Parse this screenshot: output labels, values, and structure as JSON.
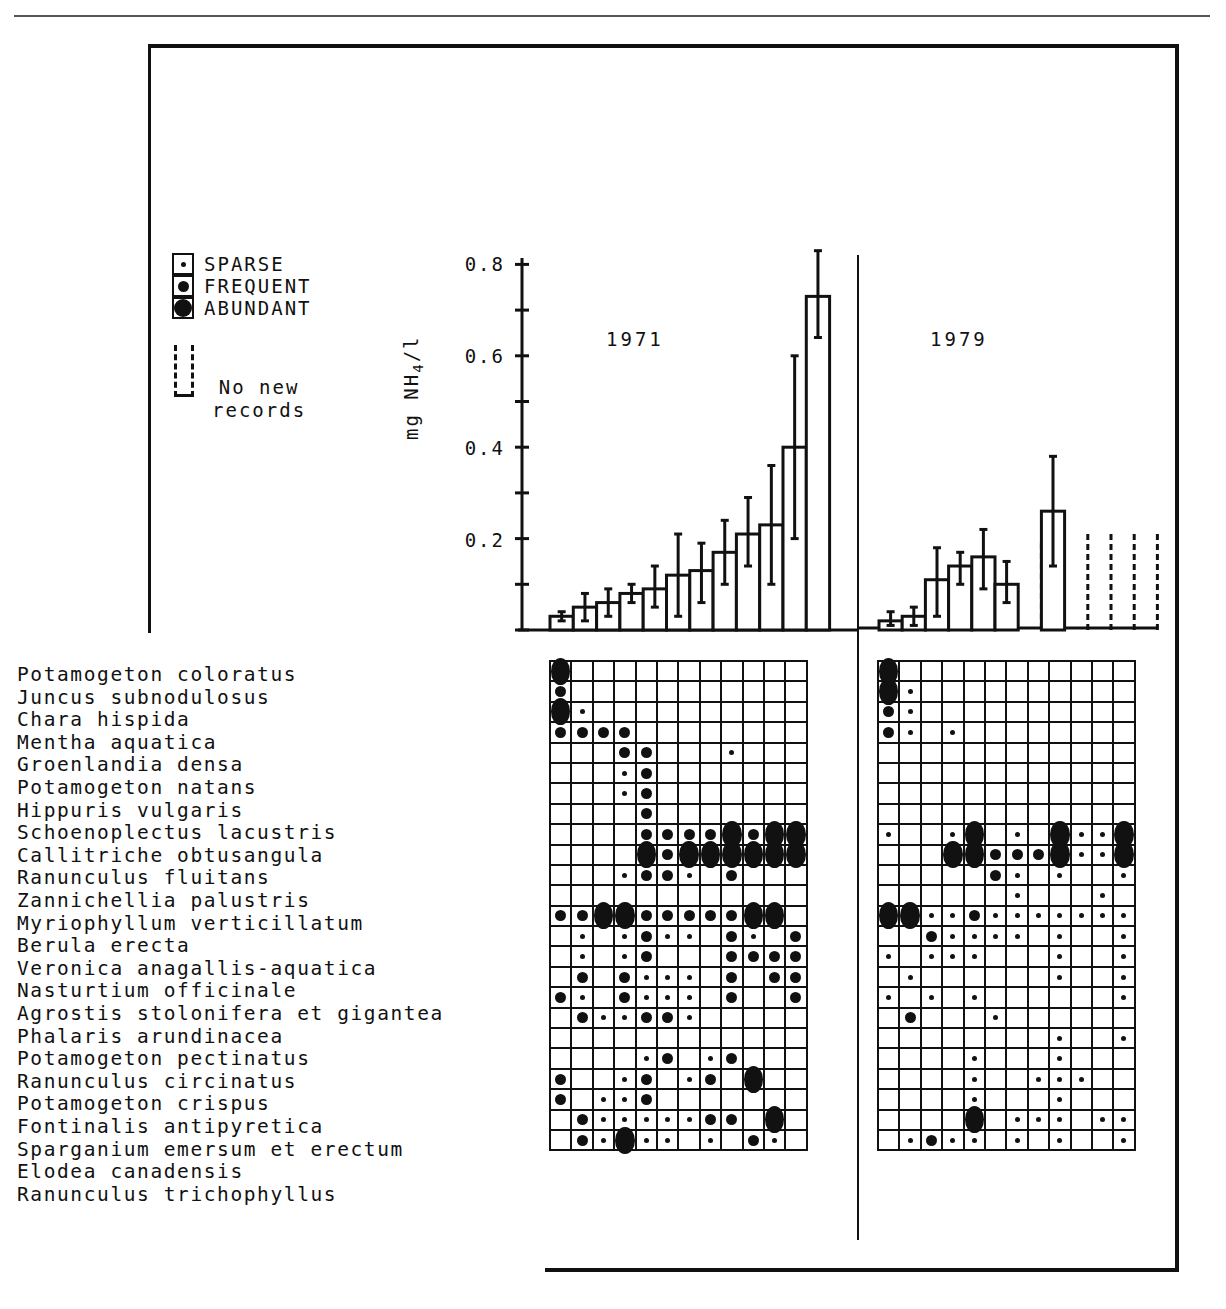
{
  "legend": {
    "items": [
      {
        "key": "S",
        "label": "SPARSE"
      },
      {
        "key": "F",
        "label": "FREQUENT"
      },
      {
        "key": "A",
        "label": "ABUNDANT"
      }
    ],
    "no_new_records_line1": "No new",
    "no_new_records_line2": "records"
  },
  "chart_data": [
    {
      "type": "bar",
      "title": "1971",
      "ylabel": "mg NH4/l",
      "xlabel": "",
      "ylim": [
        0,
        0.8
      ],
      "yticks": [
        "0.2",
        "0.4",
        "0.6",
        "0.8"
      ],
      "grid": false,
      "categories": [
        "1",
        "2",
        "3",
        "4",
        "5",
        "6",
        "7",
        "8",
        "9",
        "10",
        "11",
        "12"
      ],
      "values": [
        0.03,
        0.05,
        0.06,
        0.08,
        0.09,
        0.12,
        0.13,
        0.17,
        0.21,
        0.23,
        0.4,
        0.73
      ],
      "error_low": [
        0.02,
        0.02,
        0.03,
        0.06,
        0.05,
        0.03,
        0.06,
        0.1,
        0.14,
        0.1,
        0.2,
        0.64
      ],
      "error_high": [
        0.04,
        0.08,
        0.09,
        0.1,
        0.14,
        0.21,
        0.19,
        0.24,
        0.29,
        0.36,
        0.6,
        0.83
      ]
    },
    {
      "type": "bar",
      "title": "1979",
      "ylabel": "mg NH4/l",
      "xlabel": "",
      "ylim": [
        0,
        0.8
      ],
      "grid": false,
      "categories": [
        "1",
        "2",
        "3",
        "4",
        "5",
        "6",
        "7",
        "8",
        "9",
        "10",
        "11",
        "12"
      ],
      "values": [
        0.02,
        0.03,
        0.11,
        0.14,
        0.16,
        0.1,
        null,
        0.26,
        null,
        null,
        null,
        null
      ],
      "error_low": [
        0.01,
        0.01,
        0.03,
        0.1,
        0.09,
        0.06,
        null,
        0.14,
        null,
        null,
        null,
        null
      ],
      "error_high": [
        0.04,
        0.05,
        0.18,
        0.17,
        0.22,
        0.15,
        null,
        0.38,
        null,
        null,
        null,
        null
      ],
      "no_new_records": [
        7,
        9,
        10,
        11,
        12
      ]
    },
    {
      "type": "table",
      "title": "Species abundance by site (S = sparse, F = frequent, A = abundant)",
      "species": [
        "Potamogeton coloratus",
        "Juncus subnodulosus",
        "Chara hispida",
        "Mentha aquatica",
        "Groenlandia densa",
        "Potamogeton natans",
        "Hippuris vulgaris",
        "Schoenoplectus lacustris",
        "Callitriche obtusangula",
        "Ranunculus fluitans",
        "Zannichellia palustris",
        "Myriophyllum verticillatum",
        "Berula erecta",
        "Veronica anagallis-aquatica",
        "Nasturtium officinale",
        "Agrostis stolonifera et gigantea",
        "Phalaris arundinacea",
        "Potamogeton pectinatus",
        "Ranunculus circinatus",
        "Potamogeton crispus",
        "Fontinalis antipyretica",
        "Sparganium emersum et erectum",
        "Elodea canadensis",
        "Ranunculus trichophyllus"
      ],
      "grid_1971": [
        "A-----------",
        "F-----------",
        "AS----------",
        "FFFF--------",
        "---FF---S---",
        "---SF-------",
        "---SF-------",
        "----F-------",
        "----FFFFAFAA",
        "----AFAAAAAA",
        "---SFFS-F---",
        "------------",
        "FFAAFFFFFAA-",
        "-S-SFSS-FS-F",
        "-S-SF---FFFF",
        "-F-FSSS-F-FF",
        "FS-FSSS-F--F",
        "-FSSFFS-----",
        "------------",
        "----SF-SF---",
        "F--SF-SF-A--",
        "F-SSF-------",
        "-FSSSSSFF-A-",
        "-FSASS-S-FS-F"
      ],
      "grid_1979": [
        "A-----------",
        "AS----------",
        "FS----------",
        "FS-S--------",
        "------------",
        "------------",
        "------------",
        "------------",
        "S--SA-S-ASSA",
        "---AAFFFASSA",
        "-----FS-S--S",
        "------S---S-",
        "AASSFSSSSSSS",
        "--FSSSS-S--S",
        "S-SSS---S--S",
        "-S------S--S",
        "S-S-S------S",
        "-F---S------",
        "--------S--S",
        "----S---S---",
        "----S--SSS--",
        "----S---S---",
        "----A-SSS-SS",
        "-SFSS-S-S--S"
      ]
    }
  ]
}
